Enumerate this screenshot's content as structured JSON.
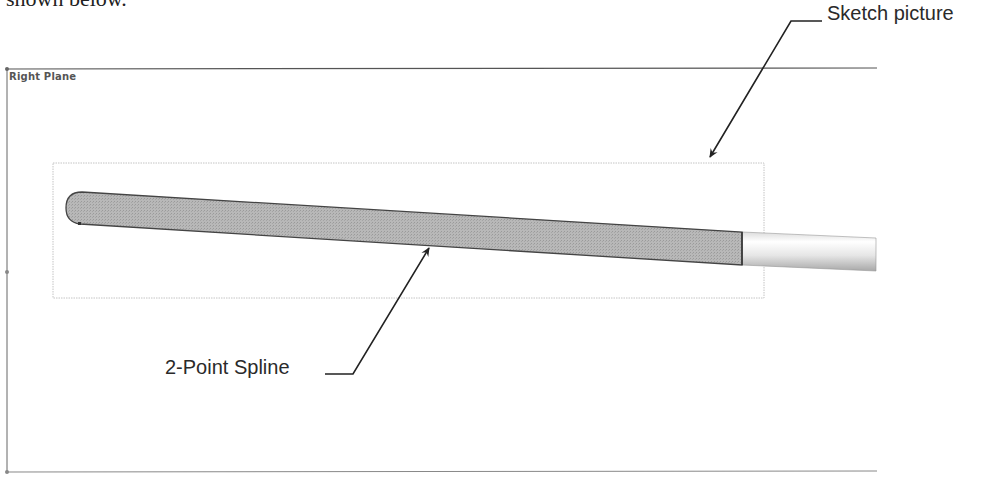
{
  "header": {
    "text": "shown below."
  },
  "viewport": {
    "plane_label": "Right Plane",
    "colors": {
      "frame": "#555555",
      "shape_fill": "#b3b3b3",
      "shape_stroke": "#444444",
      "rod_light": "#eeeeee",
      "dotted_box": "#bbbbbb"
    }
  },
  "callouts": [
    {
      "id": "sketch-picture",
      "label": "Sketch picture"
    },
    {
      "id": "two-point-spline",
      "label": "2-Point Spline"
    }
  ]
}
